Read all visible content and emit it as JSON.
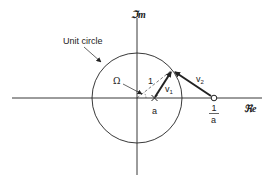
{
  "diagram": {
    "axes": {
      "imaginary_label": "ℑm",
      "real_label": "ℜe"
    },
    "labels": {
      "unit_circle": "Unit circle",
      "omega": "Ω",
      "radius": "1",
      "v1": "v",
      "v1_sub": "1",
      "v2": "v",
      "v2_sub": "2",
      "point_a": "a",
      "recip_num": "1",
      "recip_den": "a"
    },
    "points": [
      {
        "name": "origin",
        "marker": "none"
      },
      {
        "name": "a",
        "marker": "cross"
      },
      {
        "name": "1/a",
        "marker": "open-circle"
      },
      {
        "name": "e^jΩ",
        "marker": "none"
      }
    ],
    "vectors": [
      {
        "name": "v1",
        "from": "a",
        "to": "e^jΩ"
      },
      {
        "name": "v2",
        "from": "1/a",
        "to": "e^jΩ"
      }
    ],
    "colors": {
      "ink": "#222222",
      "background": "#ffffff"
    }
  }
}
